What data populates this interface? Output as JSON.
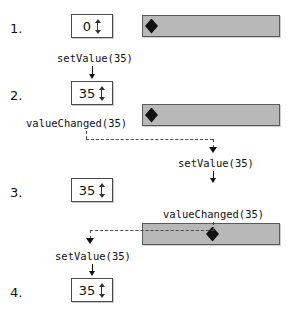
{
  "diagram": {
    "colors": {
      "slider_groove": "#b8b8b8",
      "slider_border": "#5a5a5a",
      "spinbox_bg": "#ffffff",
      "spinbox_border": "#4a4a4a",
      "handle": "#111111",
      "dashed_line": "#4a4a4a",
      "text": "#111111"
    },
    "steps": [
      {
        "number": "1.",
        "spinbox_value": "0",
        "slider_handle_percent": 0
      },
      {
        "number": "2.",
        "spinbox_value": "35",
        "slider_handle_percent": 0
      },
      {
        "number": "3.",
        "spinbox_value": "35",
        "slider_handle_percent": 35
      },
      {
        "number": "4.",
        "spinbox_value": "35",
        "slider_handle_percent": 35
      }
    ],
    "labels": {
      "set_value_to_spinbox_1": "setValue(35)",
      "value_changed_from_spinbox": "valueChanged(35)",
      "set_value_to_slider": "setValue(35)",
      "value_changed_from_slider": "valueChanged(35)",
      "set_value_to_spinbox_2": "setValue(35)"
    },
    "spin_arrows_icon": "spin-up-down-arrows-icon",
    "handle_icon": "diamond-handle-icon"
  }
}
